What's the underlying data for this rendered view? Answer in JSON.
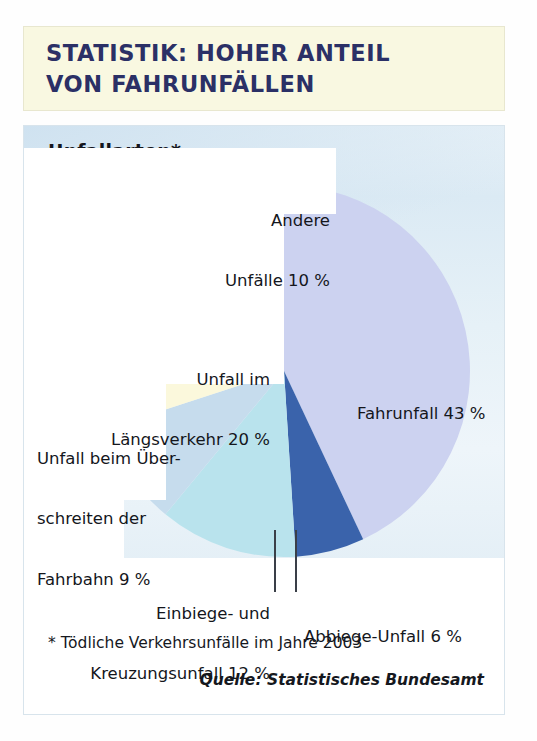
{
  "banner": {
    "line1": "STATISTIK: HOHER ANTEIL",
    "line2": "VON FAHRUNFÄLLEN"
  },
  "card": {
    "title": "Unfallarten*",
    "footnote": "* Tödliche Verkehrsunfälle im Jahre 2003",
    "source": "Quelle: Statistisches Bundesamt"
  },
  "labels": {
    "andere_l1": "Andere",
    "andere_l2": "Unfälle 10 %",
    "laengs_l1": "Unfall im",
    "laengs_l2": "Längsverkehr 20 %",
    "ueber_l1": "Unfall beim Über-",
    "ueber_l2": "schreiten der",
    "ueber_l3": "Fahrbahn 9 %",
    "einbiege_l1": "Einbiege- und",
    "einbiege_l2": "Kreuzungsunfall 12 %",
    "abbiege": "Abbiege-Unfall 6 %",
    "fahrunfall": "Fahrunfall 43 %"
  },
  "chart_data": {
    "type": "pie",
    "title": "Unfallarten*",
    "subtitle": "STATISTIK: HOHER ANTEIL VON FAHRUNFÄLLEN",
    "note": "* Tödliche Verkehrsunfälle im Jahre 2003",
    "source": "Quelle: Statistisches Bundesamt",
    "unit": "%",
    "total": 100,
    "start_angle_deg": 0,
    "direction": "clockwise",
    "legend": "labels placed around slices",
    "categories": [
      "Fahrunfall",
      "Abbiege-Unfall",
      "Einbiege- und Kreuzungsunfall",
      "Unfall beim Überschreiten der Fahrbahn",
      "Unfall im Längsverkehr",
      "Andere Unfälle"
    ],
    "values": [
      43,
      6,
      12,
      9,
      20,
      10
    ],
    "labels": [
      "Fahrunfall 43 %",
      "Abbiege-Unfall 6 %",
      "Einbiege- und Kreuzungsunfall 12 %",
      "Unfall beim Überschreiten der Fahrbahn 9 %",
      "Unfall im Längsverkehr 20 %",
      "Andere Unfälle 10 %"
    ],
    "colors": [
      "#ccd2f0",
      "#3a63ab",
      "#b9e3ed",
      "#c6dced",
      "#fbf8dc",
      "#fdfce9"
    ]
  },
  "colors": {
    "banner_bg": "#f9f8e1",
    "banner_text": "#2b3066",
    "card_bg": "#e3eff6",
    "text": "#14161c",
    "slice_fahrunfall": "#ccd2f0",
    "slice_abbiege": "#3a63ab",
    "slice_einbiege": "#b9e3ed",
    "slice_ueberschreiten": "#c6dced",
    "slice_laengsverkehr": "#fbf8dc",
    "slice_andere": "#fdfce9"
  }
}
